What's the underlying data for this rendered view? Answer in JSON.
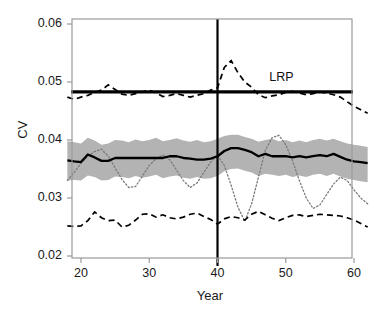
{
  "figure": {
    "title": "",
    "axis_label_y": "CV",
    "axis_label_x": "Year",
    "annotation_lrp": "LRP"
  },
  "ticks": {
    "y": [
      "0.06",
      "0.05",
      "0.04",
      "0.03",
      "0.02"
    ],
    "x": [
      "20",
      "30",
      "40",
      "50",
      "60"
    ]
  },
  "colors": {
    "band": "#b3b3b3",
    "line": "#000000",
    "frame": "#9a9a9a",
    "text": "#1a1a1a"
  },
  "chart_data": {
    "type": "line",
    "title": "",
    "xlabel": "Year",
    "ylabel": "CV",
    "xlim": [
      18,
      62
    ],
    "ylim": [
      0.02,
      0.06
    ],
    "xticks": [
      20,
      30,
      40,
      50,
      60
    ],
    "yticks": [
      0.02,
      0.03,
      0.04,
      0.05,
      0.06
    ],
    "grid": false,
    "legend": false,
    "annotations": [
      {
        "text": "LRP",
        "x": 49.5,
        "y": 0.0505,
        "note": "label above thick horizontal reference line"
      }
    ],
    "reference_lines": [
      {
        "name": "LRP",
        "orientation": "horizontal",
        "y": 0.0483,
        "style": "solid",
        "width": 3.2
      },
      {
        "name": "year-40-divider",
        "orientation": "vertical",
        "x": 40,
        "style": "solid",
        "width": 2.2
      }
    ],
    "x": [
      18,
      19,
      20,
      21,
      22,
      23,
      24,
      25,
      26,
      27,
      28,
      29,
      30,
      31,
      32,
      33,
      34,
      35,
      36,
      37,
      38,
      39,
      40,
      41,
      42,
      43,
      44,
      45,
      46,
      47,
      48,
      49,
      50,
      51,
      52,
      53,
      54,
      55,
      56,
      57,
      58,
      59,
      60,
      61,
      62
    ],
    "series": [
      {
        "name": "median CV (solid black)",
        "style": "solid",
        "color": "#000000",
        "width": 2.2,
        "values": [
          0.0365,
          0.0363,
          0.0362,
          0.0375,
          0.037,
          0.0364,
          0.0364,
          0.0369,
          0.0369,
          0.0369,
          0.0369,
          0.0369,
          0.0369,
          0.0369,
          0.0369,
          0.0372,
          0.0372,
          0.0369,
          0.0368,
          0.0366,
          0.0366,
          0.0368,
          0.0372,
          0.0381,
          0.0386,
          0.0386,
          0.0383,
          0.0379,
          0.0372,
          0.0376,
          0.0372,
          0.0372,
          0.0372,
          0.037,
          0.0372,
          0.037,
          0.0372,
          0.0374,
          0.0372,
          0.0376,
          0.0371,
          0.0366,
          0.0363,
          0.0362,
          0.036
        ]
      },
      {
        "name": "CI upper (gray band top)",
        "style": "band-upper",
        "color": "#b3b3b3",
        "values": [
          0.0398,
          0.0396,
          0.0394,
          0.0404,
          0.0399,
          0.0392,
          0.0394,
          0.04,
          0.0399,
          0.0396,
          0.0401,
          0.0398,
          0.04,
          0.0404,
          0.0398,
          0.04,
          0.0403,
          0.0399,
          0.0397,
          0.04,
          0.0396,
          0.0398,
          0.0402,
          0.0407,
          0.0409,
          0.0409,
          0.0405,
          0.0402,
          0.0397,
          0.04,
          0.0402,
          0.0398,
          0.04,
          0.0396,
          0.0399,
          0.0396,
          0.04,
          0.0402,
          0.0399,
          0.0402,
          0.0398,
          0.0394,
          0.0392,
          0.039,
          0.0388
        ]
      },
      {
        "name": "CI lower (gray band bottom)",
        "style": "band-lower",
        "color": "#b3b3b3",
        "values": [
          0.033,
          0.0331,
          0.033,
          0.0339,
          0.0336,
          0.033,
          0.0331,
          0.0337,
          0.0336,
          0.0334,
          0.0338,
          0.0335,
          0.0337,
          0.034,
          0.0334,
          0.0337,
          0.0339,
          0.0335,
          0.0333,
          0.0336,
          0.0333,
          0.0334,
          0.0338,
          0.0346,
          0.035,
          0.0351,
          0.0347,
          0.0344,
          0.0338,
          0.0342,
          0.034,
          0.0338,
          0.034,
          0.0336,
          0.0339,
          0.0336,
          0.034,
          0.0342,
          0.0338,
          0.0342,
          0.0337,
          0.0333,
          0.0331,
          0.0329,
          0.0327
        ]
      },
      {
        "name": "upper dashed envelope",
        "style": "dashed",
        "color": "#000000",
        "width": 1.6,
        "values": [
          0.0474,
          0.047,
          0.0474,
          0.0477,
          0.0482,
          0.0486,
          0.0495,
          0.0487,
          0.0479,
          0.0477,
          0.048,
          0.0483,
          0.0486,
          0.0481,
          0.0475,
          0.0477,
          0.048,
          0.0477,
          0.0474,
          0.0477,
          0.048,
          0.0486,
          0.049,
          0.0525,
          0.0537,
          0.0516,
          0.05,
          0.0491,
          0.0478,
          0.0473,
          0.0476,
          0.0478,
          0.0482,
          0.0484,
          0.0481,
          0.0478,
          0.048,
          0.0483,
          0.0481,
          0.0478,
          0.0474,
          0.0466,
          0.0458,
          0.0452,
          0.0446
        ]
      },
      {
        "name": "lower dashed envelope",
        "style": "dashed",
        "color": "#000000",
        "width": 1.6,
        "values": [
          0.0252,
          0.0251,
          0.0252,
          0.0261,
          0.0276,
          0.0266,
          0.0261,
          0.0262,
          0.025,
          0.0253,
          0.0262,
          0.0272,
          0.0273,
          0.0267,
          0.0271,
          0.0266,
          0.0264,
          0.0267,
          0.0272,
          0.0274,
          0.0268,
          0.0263,
          0.0255,
          0.0264,
          0.0268,
          0.0266,
          0.0262,
          0.0272,
          0.0277,
          0.0271,
          0.0265,
          0.0261,
          0.0266,
          0.027,
          0.0271,
          0.0268,
          0.027,
          0.0272,
          0.0271,
          0.027,
          0.0269,
          0.0266,
          0.0262,
          0.0256,
          0.025
        ]
      },
      {
        "name": "dotted realized trajectory",
        "style": "dotted",
        "color": "#7a7a7a",
        "width": 1.3,
        "values": [
          0.033,
          0.0344,
          0.036,
          0.0372,
          0.038,
          0.0384,
          0.0372,
          0.0352,
          0.0332,
          0.0318,
          0.032,
          0.0338,
          0.0356,
          0.0368,
          0.0374,
          0.0366,
          0.0348,
          0.033,
          0.0318,
          0.0326,
          0.0344,
          0.0362,
          0.0374,
          0.0356,
          0.0322,
          0.0284,
          0.026,
          0.029,
          0.0336,
          0.0382,
          0.0404,
          0.0408,
          0.0392,
          0.0364,
          0.033,
          0.03,
          0.0282,
          0.0288,
          0.0306,
          0.0324,
          0.0336,
          0.033,
          0.0314,
          0.03,
          0.029
        ]
      }
    ]
  }
}
